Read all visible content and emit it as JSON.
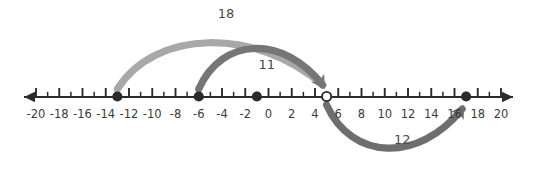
{
  "figure": {
    "type": "number-line-diagram",
    "background_color": "#ffffff"
  },
  "number_line": {
    "name": "number-line",
    "min": -20,
    "max": 20,
    "major_tick_step": 2,
    "minor_tick_step": 1,
    "axis_color": "#2b2b2b",
    "left_arrow": true,
    "right_arrow": true,
    "tick_labels": [
      "-20",
      "-18",
      "-16",
      "-14",
      "-12",
      "-10",
      "-8",
      "-6",
      "-4",
      "-2",
      "0",
      "2",
      "4",
      "6",
      "8",
      "10",
      "12",
      "14",
      "16",
      "18",
      "20"
    ],
    "tick_label_values": [
      -20,
      -18,
      -16,
      -14,
      -12,
      -10,
      -8,
      -6,
      -4,
      -2,
      0,
      2,
      4,
      6,
      8,
      10,
      12,
      14,
      16,
      18,
      20
    ]
  },
  "points": [
    {
      "name": "point-filled-neg13",
      "value": -13,
      "style": "filled",
      "color": "#2b2b2b"
    },
    {
      "name": "point-filled-neg6",
      "value": -6,
      "style": "filled",
      "color": "#2b2b2b"
    },
    {
      "name": "point-filled-neg1",
      "value": -1,
      "style": "filled",
      "color": "#2b2b2b"
    },
    {
      "name": "point-open-5",
      "value": 5,
      "style": "open",
      "color": "#2b2b2b"
    },
    {
      "name": "point-filled-17",
      "value": 17,
      "style": "filled",
      "color": "#2b2b2b"
    }
  ],
  "arcs": [
    {
      "name": "arc-18",
      "label": "18",
      "from": -13,
      "to": 5,
      "side": "above",
      "color": "#a8a8a8",
      "label_x": 0,
      "label_y": 18
    },
    {
      "name": "arc-11",
      "label": "11",
      "from": -6,
      "to": 5,
      "side": "above",
      "color": "#767676",
      "label_x": 0,
      "label_y": 69
    },
    {
      "name": "arc-12",
      "label": "12",
      "from": 5,
      "to": 17,
      "side": "below",
      "color": "#6e6e6e",
      "label_x": 0,
      "label_y": 144
    }
  ],
  "chart_data": {
    "type": "number-line",
    "title": "",
    "xlabel": "",
    "ylabel": "",
    "xlim": [
      -20,
      20
    ],
    "grid": false,
    "categories": [
      "-20",
      "-18",
      "-16",
      "-14",
      "-12",
      "-10",
      "-8",
      "-6",
      "-4",
      "-2",
      "0",
      "2",
      "4",
      "6",
      "8",
      "10",
      "12",
      "14",
      "16",
      "18",
      "20"
    ],
    "values": [
      -20,
      -18,
      -16,
      -14,
      -12,
      -10,
      -8,
      -6,
      -4,
      -2,
      0,
      2,
      4,
      6,
      8,
      10,
      12,
      14,
      16,
      18,
      20
    ],
    "marked_points": [
      -13,
      -6,
      -1,
      5,
      17
    ],
    "open_points": [
      5
    ],
    "jumps": [
      {
        "label": "18",
        "start": -13,
        "end": 5,
        "magnitude": 18,
        "direction": "right",
        "side": "above"
      },
      {
        "label": "11",
        "start": -6,
        "end": 5,
        "magnitude": 11,
        "direction": "right",
        "side": "above"
      },
      {
        "label": "12",
        "start": 5,
        "end": 17,
        "magnitude": 12,
        "direction": "right",
        "side": "below"
      }
    ],
    "annotations": [
      "18",
      "11",
      "12"
    ]
  }
}
